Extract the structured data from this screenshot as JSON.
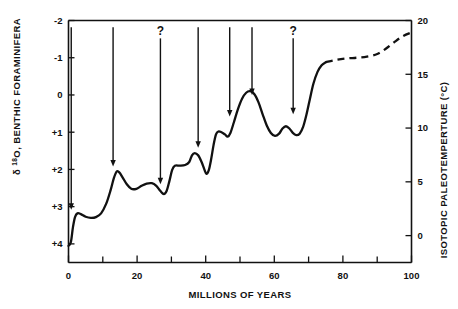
{
  "chart_data": {
    "type": "line",
    "title": "",
    "xlabel": "MILLIONS OF YEARS",
    "ylabel_left": "δ 18O, BENTHIC FORAMINIFERA",
    "ylabel_left_symbol": "δ",
    "ylabel_left_sup": "18",
    "ylabel_left_rest": "O, BENTHIC FORAMINIFERA",
    "ylabel_right": "ISOTOPIC PALEOTEMPERTURE (°C)",
    "xlim": [
      0,
      100
    ],
    "ylim_left": [
      4.5,
      -2
    ],
    "ylim_right": [
      -2.5,
      20
    ],
    "grid": false,
    "legend": "none",
    "xticks": [
      0,
      20,
      40,
      60,
      80,
      100
    ],
    "xtick_labels": [
      "0",
      "20",
      "40",
      "60",
      "80",
      "100"
    ],
    "xminor_ticks": [
      10,
      30,
      50,
      70,
      90
    ],
    "yticks_left": [
      -2,
      -1,
      0,
      1,
      2,
      3,
      4
    ],
    "ytick_labels_left": [
      "-2",
      "-1",
      "0",
      "+1",
      "+2",
      "+3",
      "+4"
    ],
    "yticks_right": [
      20,
      15,
      10,
      5,
      0
    ],
    "ytick_labels_right": [
      "20",
      "15",
      "10",
      "5",
      "0"
    ],
    "series": [
      {
        "name": "benthic foraminifera delta-18-O",
        "style": "solid",
        "points": [
          [
            0.0,
            4.05
          ],
          [
            0.7,
            3.95
          ],
          [
            1.3,
            3.55
          ],
          [
            1.9,
            3.28
          ],
          [
            2.6,
            3.18
          ],
          [
            3.6,
            3.2
          ],
          [
            5.0,
            3.27
          ],
          [
            6.5,
            3.3
          ],
          [
            8.0,
            3.28
          ],
          [
            9.5,
            3.18
          ],
          [
            11.0,
            2.92
          ],
          [
            12.3,
            2.55
          ],
          [
            13.2,
            2.24
          ],
          [
            14.0,
            2.06
          ],
          [
            14.8,
            2.08
          ],
          [
            15.8,
            2.22
          ],
          [
            17.0,
            2.4
          ],
          [
            18.3,
            2.52
          ],
          [
            19.8,
            2.52
          ],
          [
            21.3,
            2.44
          ],
          [
            22.8,
            2.38
          ],
          [
            24.3,
            2.37
          ],
          [
            25.6,
            2.44
          ],
          [
            26.8,
            2.58
          ],
          [
            27.8,
            2.66
          ],
          [
            28.6,
            2.58
          ],
          [
            29.4,
            2.32
          ],
          [
            30.2,
            2.02
          ],
          [
            31.0,
            1.9
          ],
          [
            32.5,
            1.9
          ],
          [
            34.0,
            1.88
          ],
          [
            35.2,
            1.8
          ],
          [
            36.0,
            1.62
          ],
          [
            36.8,
            1.56
          ],
          [
            37.8,
            1.62
          ],
          [
            38.8,
            1.8
          ],
          [
            39.6,
            2.0
          ],
          [
            40.2,
            2.12
          ],
          [
            40.9,
            2.02
          ],
          [
            41.6,
            1.72
          ],
          [
            42.3,
            1.34
          ],
          [
            43.0,
            1.06
          ],
          [
            43.7,
            0.98
          ],
          [
            44.6,
            1.0
          ],
          [
            45.6,
            1.06
          ],
          [
            46.4,
            1.12
          ],
          [
            47.2,
            1.02
          ],
          [
            48.2,
            0.74
          ],
          [
            49.4,
            0.38
          ],
          [
            50.6,
            0.1
          ],
          [
            51.8,
            -0.06
          ],
          [
            53.0,
            -0.1
          ],
          [
            54.2,
            -0.02
          ],
          [
            55.4,
            0.2
          ],
          [
            56.6,
            0.52
          ],
          [
            57.8,
            0.82
          ],
          [
            59.0,
            1.02
          ],
          [
            60.2,
            1.1
          ],
          [
            61.4,
            1.04
          ],
          [
            62.4,
            0.9
          ],
          [
            63.4,
            0.84
          ],
          [
            64.4,
            0.9
          ],
          [
            65.4,
            1.02
          ],
          [
            66.4,
            1.08
          ],
          [
            67.4,
            1.04
          ],
          [
            68.4,
            0.86
          ],
          [
            69.4,
            0.52
          ],
          [
            70.4,
            0.1
          ],
          [
            71.4,
            -0.3
          ],
          [
            72.6,
            -0.62
          ],
          [
            73.8,
            -0.8
          ],
          [
            75.0,
            -0.88
          ]
        ]
      },
      {
        "name": "benthic foraminifera delta-18-O (inferred)",
        "style": "dashed",
        "points": [
          [
            75.0,
            -0.88
          ],
          [
            78.0,
            -0.94
          ],
          [
            81.0,
            -0.98
          ],
          [
            84.0,
            -1.0
          ],
          [
            87.0,
            -1.03
          ],
          [
            90.0,
            -1.1
          ],
          [
            92.5,
            -1.24
          ],
          [
            95.0,
            -1.42
          ],
          [
            97.5,
            -1.58
          ],
          [
            100.0,
            -1.68
          ]
        ]
      }
    ],
    "annotations": [
      {
        "name": "arrow-1",
        "x": 0.8,
        "y_top": -1.82,
        "y_tip": 3.08,
        "label": ""
      },
      {
        "name": "arrow-2",
        "x": 13.0,
        "y_top": -1.82,
        "y_tip": 1.92,
        "label": ""
      },
      {
        "name": "arrow-3",
        "x": 26.8,
        "y_top": -1.52,
        "y_tip": 2.4,
        "label": "?"
      },
      {
        "name": "arrow-4",
        "x": 37.8,
        "y_top": -1.82,
        "y_tip": 1.42,
        "label": ""
      },
      {
        "name": "arrow-5",
        "x": 47.0,
        "y_top": -1.82,
        "y_tip": 0.58,
        "label": ""
      },
      {
        "name": "arrow-6",
        "x": 53.5,
        "y_top": -1.82,
        "y_tip": 0.0,
        "label": ""
      },
      {
        "name": "arrow-7",
        "x": 65.5,
        "y_top": -1.52,
        "y_tip": 0.52,
        "label": "?"
      }
    ]
  }
}
